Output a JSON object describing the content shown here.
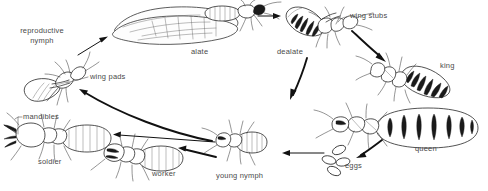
{
  "diagram": {
    "type": "life-cycle-diagram",
    "background_color": "#ffffff",
    "ink_color": "#1a1a1a",
    "label_color": "#4a4a4a",
    "labels": {
      "reproductive_nymph": "reproductive\nnymph",
      "reproductive_nymph_line1": "reproductive",
      "reproductive_nymph_line2": "nymph",
      "wing_pads": "wing pads",
      "alate": "alate",
      "dealate": "dealate",
      "wing_stubs": "wing stubs",
      "king": "king",
      "queen": "queen",
      "eggs": "eggs",
      "young_nymph": "young nymph",
      "worker": "worker",
      "soldier": "soldier",
      "mandibles": "mandibles"
    },
    "stages": [
      {
        "id": "reproductive-nymph",
        "label": "reproductive nymph",
        "x": 44,
        "y": 75
      },
      {
        "id": "alate",
        "label": "alate",
        "x": 175,
        "y": 30
      },
      {
        "id": "dealate",
        "label": "dealate",
        "x": 300,
        "y": 28
      },
      {
        "id": "king",
        "label": "king",
        "x": 400,
        "y": 80
      },
      {
        "id": "queen",
        "label": "queen",
        "x": 420,
        "y": 125
      },
      {
        "id": "eggs",
        "label": "eggs",
        "x": 350,
        "y": 155
      },
      {
        "id": "young-nymph",
        "label": "young nymph",
        "x": 240,
        "y": 150
      },
      {
        "id": "worker",
        "label": "worker",
        "x": 165,
        "y": 160
      },
      {
        "id": "soldier",
        "label": "soldier",
        "x": 55,
        "y": 140
      }
    ],
    "callouts": [
      {
        "id": "wing-pads",
        "label": "wing pads",
        "target": "reproductive-nymph"
      },
      {
        "id": "wing-stubs",
        "label": "wing stubs",
        "target": "dealate"
      },
      {
        "id": "mandibles",
        "label": "mandibles",
        "target": "soldier"
      }
    ],
    "flow": [
      {
        "from": "reproductive-nymph",
        "to": "alate"
      },
      {
        "from": "alate",
        "to": "dealate"
      },
      {
        "from": "dealate",
        "to": "king"
      },
      {
        "from": "dealate",
        "to": "queen"
      },
      {
        "from": "queen",
        "to": "eggs"
      },
      {
        "from": "eggs",
        "to": "young-nymph"
      },
      {
        "from": "young-nymph",
        "to": "worker"
      },
      {
        "from": "young-nymph",
        "to": "soldier"
      },
      {
        "from": "young-nymph",
        "to": "reproductive-nymph"
      }
    ]
  }
}
